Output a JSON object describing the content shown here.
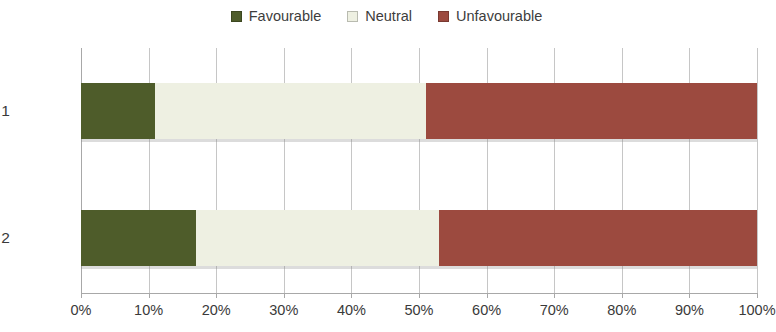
{
  "legend": {
    "position": "top-center",
    "entries": [
      {
        "label": "Favourable",
        "color": "#4e5c2a",
        "icon": "legend-swatch-icon"
      },
      {
        "label": "Neutral",
        "color": "#eef0e2",
        "icon": "legend-swatch-icon"
      },
      {
        "label": "Unfavourable",
        "color": "#9c4a3f",
        "icon": "legend-swatch-icon"
      }
    ]
  },
  "axis": {
    "x_tick_labels": [
      "0%",
      "10%",
      "20%",
      "30%",
      "40%",
      "50%",
      "60%",
      "70%",
      "80%",
      "90%",
      "100%"
    ],
    "y_tick_labels": [
      "Phase 1",
      "Phase 2"
    ]
  },
  "chart_data": {
    "type": "bar",
    "orientation": "horizontal",
    "stacked": true,
    "stack_mode": "percent",
    "title": "",
    "subtitle": "",
    "xlabel": "",
    "ylabel": "",
    "categories": [
      "Phase 1",
      "Phase 2"
    ],
    "xlim": [
      0,
      100
    ],
    "xticks": [
      0,
      10,
      20,
      30,
      40,
      50,
      60,
      70,
      80,
      90,
      100
    ],
    "xtick_labels": [
      "0%",
      "10%",
      "20%",
      "30%",
      "40%",
      "50%",
      "60%",
      "70%",
      "80%",
      "90%",
      "100%"
    ],
    "grid": "vertical",
    "legend_position": "top-center",
    "series": [
      {
        "name": "Favourable",
        "color": "#4e5c2a",
        "values": [
          11,
          17
        ]
      },
      {
        "name": "Neutral",
        "color": "#eef0e2",
        "values": [
          40,
          36
        ]
      },
      {
        "name": "Unfavourable",
        "color": "#9c4a3f",
        "values": [
          49,
          47
        ]
      }
    ]
  }
}
